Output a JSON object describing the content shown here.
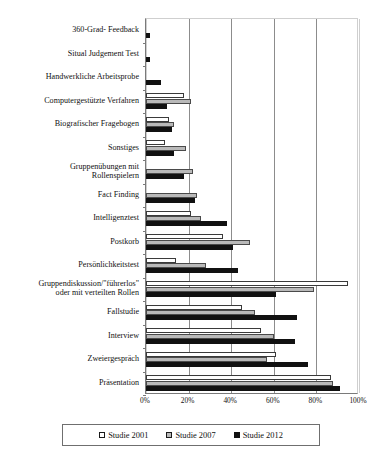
{
  "chart_data": {
    "type": "bar",
    "orientation": "horizontal",
    "title": "",
    "xlabel": "",
    "ylabel": "",
    "xlim": [
      0,
      100
    ],
    "xticks": [
      "0%",
      "20%",
      "40%",
      "60%",
      "80%",
      "100%"
    ],
    "xtick_values": [
      0,
      20,
      40,
      60,
      80,
      100
    ],
    "grid": true,
    "legend_position": "bottom",
    "categories": [
      "360-Grad- Feedback",
      "Situal Judgement Test",
      "Handwerkliche Arbeitsprobe",
      "Computergestützte Verfahren",
      "Biografischer Fragebogen",
      "Sonstiges",
      "Gruppenübungen mit Rollenspielern",
      "Fact Finding",
      "Intelligenztest",
      "Postkorb",
      "Persönlichkeitstest",
      "Gruppendiskussion/\"führerlos\" oder mit verteilten Rollen",
      "Fallstudie",
      "Interview",
      "Zweiergespräch",
      "Präsentation"
    ],
    "category_lines": [
      [
        "360-Grad- Feedback"
      ],
      [
        "Situal Judgement Test"
      ],
      [
        "Handwerkliche Arbeitsprobe"
      ],
      [
        "Computergestützte Verfahren"
      ],
      [
        "Biografischer Fragebogen"
      ],
      [
        "Sonstiges"
      ],
      [
        "Gruppenübungen mit",
        "Rollenspielern"
      ],
      [
        "Fact Finding"
      ],
      [
        "Intelligenztest"
      ],
      [
        "Postkorb"
      ],
      [
        "Persönlichkeitstest"
      ],
      [
        "Gruppendiskussion/\"führerlos\"",
        "oder mit verteilten Rollen"
      ],
      [
        "Fallstudie"
      ],
      [
        "Interview"
      ],
      [
        "Zweiergespräch"
      ],
      [
        "Präsentation"
      ]
    ],
    "series": [
      {
        "name": "Studie 2001",
        "color": "#ffffff",
        "values": [
          0,
          0,
          0,
          18,
          11,
          9,
          0,
          0,
          21,
          36,
          14,
          95,
          45,
          54,
          61,
          87
        ]
      },
      {
        "name": "Studie 2007",
        "color": "#b9b9b9",
        "values": [
          0,
          0,
          0,
          21,
          13,
          19,
          22,
          24,
          26,
          49,
          28,
          79,
          51,
          60,
          57,
          88
        ]
      },
      {
        "name": "Studie 2012",
        "color": "#111111",
        "values": [
          2,
          2,
          7,
          10,
          12,
          13,
          18,
          23,
          38,
          41,
          43,
          61,
          71,
          70,
          76,
          91
        ]
      }
    ]
  },
  "legend": {
    "items": [
      {
        "label": "Studie 2001",
        "swatch": "white-square-icon"
      },
      {
        "label": "Studie 2007",
        "swatch": "gray-square-icon"
      },
      {
        "label": "Studie 2012",
        "swatch": "black-square-icon"
      }
    ]
  }
}
